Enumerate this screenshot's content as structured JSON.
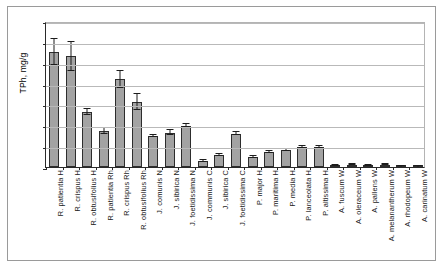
{
  "chart_data": {
    "type": "bar",
    "title": "",
    "subtitle": "",
    "xlabel": "",
    "ylabel": "TPh, mg/g",
    "ylim": [
      0,
      700
    ],
    "ytick_step": 100,
    "yticks": [
      0,
      100,
      200,
      300,
      400,
      500,
      600,
      700
    ],
    "ytick_labels": [
      "0",
      "100",
      "200",
      "300",
      "400",
      "500",
      "600",
      "700"
    ],
    "grid": "horizontal",
    "legend": "none",
    "bar_color": "#a3a3a3",
    "bar_edge_color": "#2d2d2d",
    "error_bar_color": "#1c1c1c",
    "error_type": "symmetric",
    "categories": [
      "R. patientia H",
      "R. crispus H",
      "R. obtusifolius H",
      "R. patientia Rh",
      "R. crispus Rh",
      "R. obtusifolius Rh",
      "J. comunis N",
      "J. sibirica N",
      "J. foetidissima N",
      "J. communis C",
      "J. sibirica C",
      "J. foetidissima C",
      "P. major H",
      "P. maritima H",
      "P. media H",
      "P. lanceolata H",
      "P. altissima H",
      "A. fuscum W",
      "A. oleraceum W",
      "A. pallens W",
      "A. melanantherum W",
      "A. rhodopeum W",
      "A. carinatum W"
    ],
    "values": [
      550,
      530,
      265,
      172,
      420,
      312,
      148,
      165,
      198,
      30,
      58,
      160,
      48,
      72,
      82,
      98,
      95,
      8,
      12,
      7,
      11,
      5,
      5
    ],
    "errors": [
      62,
      68,
      14,
      13,
      40,
      38,
      6,
      11,
      6,
      4,
      4,
      8,
      4,
      5,
      6,
      5,
      4,
      2,
      2,
      2,
      2,
      2,
      2
    ]
  }
}
